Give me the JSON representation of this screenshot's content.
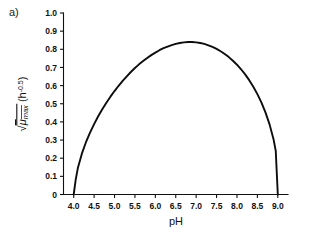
{
  "panel": {
    "label": "a)"
  },
  "chart_data": {
    "type": "line",
    "title": "",
    "subtitle": "",
    "xlabel": "pH",
    "ylabel_parts": {
      "radical": "√",
      "mu": "μ",
      "subscript": "max",
      "units_open": "(h",
      "units_exponent": "-0.5",
      "units_close": ")"
    },
    "ylabel_plain": "√μmax (h-0.5)",
    "xlim": [
      3.75,
      9.25
    ],
    "ylim": [
      0.0,
      1.0
    ],
    "xticks": [
      4.0,
      4.5,
      5.0,
      5.5,
      6.0,
      6.5,
      7.0,
      7.5,
      8.0,
      8.5,
      9.0
    ],
    "xtick_labels": [
      "4.0",
      "4.5",
      "5.0",
      "5.5",
      "6.0",
      "6.5",
      "7.0",
      "7.5",
      "8.0",
      "8.5",
      "9.0"
    ],
    "yticks": [
      0.0,
      0.1,
      0.2,
      0.3,
      0.4,
      0.5,
      0.6,
      0.7,
      0.8,
      0.9,
      1.0
    ],
    "ytick_labels": [
      "0",
      "0.1",
      "0.2",
      "0.3",
      "0.4",
      "0.5",
      "0.6",
      "0.7",
      "0.8",
      "0.9",
      "1.0"
    ],
    "grid": false,
    "legend": null,
    "legend_position": "none",
    "curve_color": "#0d0d0d",
    "ph_min": 4.0,
    "ph_opt": 6.4,
    "ph_max": 9.0,
    "peak_value": 0.875,
    "series": [
      {
        "name": "sqrt(mu_max) vs pH",
        "x": [
          4.0,
          4.05,
          4.1,
          4.2,
          4.3,
          4.4,
          4.5,
          4.6,
          4.7,
          4.8,
          4.9,
          5.0,
          5.1,
          5.2,
          5.3,
          5.4,
          5.5,
          5.6,
          5.7,
          5.8,
          5.9,
          6.0,
          6.1,
          6.2,
          6.3,
          6.4,
          6.5,
          6.6,
          6.7,
          6.8,
          6.9,
          7.0,
          7.1,
          7.2,
          7.3,
          7.4,
          7.5,
          7.6,
          7.7,
          7.8,
          7.9,
          8.0,
          8.1,
          8.2,
          8.3,
          8.4,
          8.5,
          8.6,
          8.7,
          8.8,
          8.9,
          8.95,
          9.0
        ],
        "y": [
          0.0,
          0.083,
          0.144,
          0.225,
          0.288,
          0.341,
          0.388,
          0.431,
          0.47,
          0.506,
          0.539,
          0.57,
          0.599,
          0.626,
          0.651,
          0.675,
          0.697,
          0.717,
          0.735,
          0.752,
          0.768,
          0.782,
          0.795,
          0.806,
          0.815,
          0.823,
          0.83,
          0.835,
          0.838,
          0.84,
          0.84,
          0.838,
          0.835,
          0.83,
          0.822,
          0.813,
          0.802,
          0.789,
          0.774,
          0.757,
          0.737,
          0.715,
          0.69,
          0.662,
          0.63,
          0.594,
          0.553,
          0.506,
          0.451,
          0.385,
          0.3,
          0.24,
          0.0
        ]
      }
    ]
  }
}
